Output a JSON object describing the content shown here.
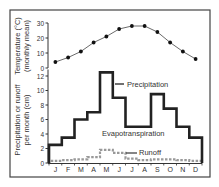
{
  "chart_data": {
    "type": "line",
    "panels": [
      {
        "id": "temperature",
        "type": "line",
        "ylabel_line1": "Temperature (°C)",
        "ylabel_line2": "(monthly mean)",
        "ylim": [
          0,
          30
        ],
        "yticks": [
          0,
          10,
          20,
          30
        ],
        "series": [
          {
            "name": "Temperature",
            "values": [
              4,
              7,
              11,
              17,
              21,
              26,
              28,
              28,
              24,
              17,
              11,
              6
            ]
          }
        ]
      },
      {
        "id": "water",
        "type": "step",
        "ylabel_line1": "Precipitation or runoff",
        "ylabel_line2": "per month (cm)",
        "ylim": [
          0,
          13
        ],
        "yticks": [
          0,
          2,
          4,
          6,
          8,
          10,
          12
        ],
        "series": [
          {
            "name": "Precipitation",
            "values": [
              2.5,
              3.5,
              6,
              7,
              12.5,
              9,
              5,
              5,
              9.5,
              7.5,
              5,
              3.5
            ],
            "color": "#222222",
            "style": "solid-thick"
          },
          {
            "name": "Runoff",
            "values": [
              0.3,
              0.4,
              0.5,
              0.8,
              1.8,
              1.4,
              0.6,
              0.4,
              0.5,
              0.5,
              0.4,
              0.3
            ],
            "color": "#999999",
            "style": "dashed"
          }
        ],
        "annotations": [
          {
            "text": "Precipitation",
            "points_to": "Precipitation"
          },
          {
            "text": "Evapotranspiration",
            "region": "between precipitation and runoff"
          },
          {
            "text": "Runoff",
            "points_to": "Runoff"
          }
        ]
      }
    ],
    "categories": [
      "J",
      "F",
      "M",
      "A",
      "M",
      "J",
      "J",
      "A",
      "S",
      "O",
      "N",
      "D"
    ],
    "xlabel": "",
    "grid": false,
    "legend": "inline annotations"
  }
}
